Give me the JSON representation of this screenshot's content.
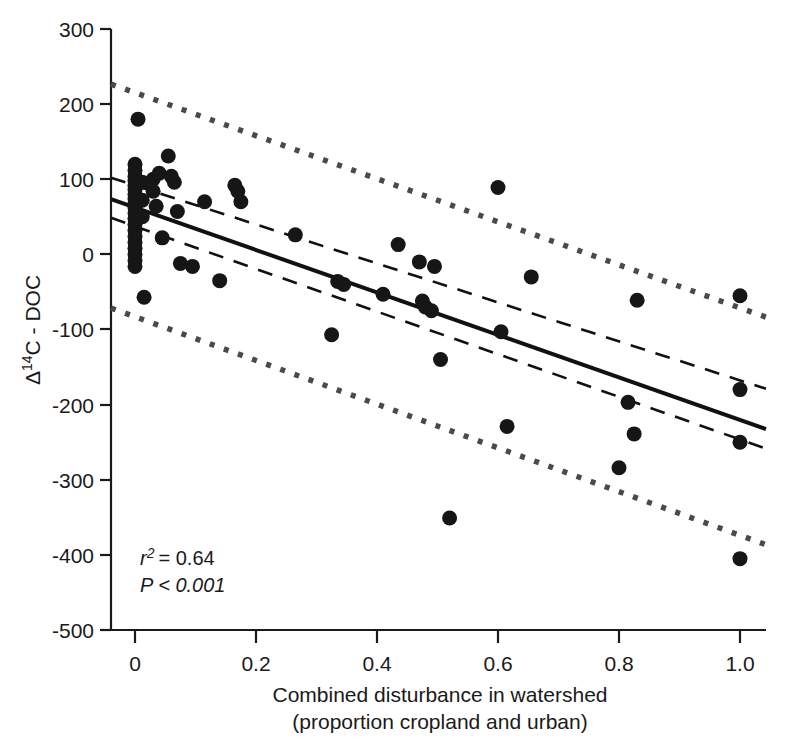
{
  "chart_data": {
    "type": "scatter",
    "title": "",
    "xlabel": "Combined disturbance in watershed",
    "xlabel_line2": "(proportion cropland and urban)",
    "ylabel": "Δ14C - DOC",
    "ylabel_delta": "Δ",
    "ylabel_sup": "14",
    "ylabel_rest": "C - DOC",
    "xlim": [
      -0.06,
      1.06
    ],
    "ylim": [
      -500,
      300
    ],
    "xticks": [
      0,
      0.2,
      0.4,
      0.6,
      0.8,
      1.0
    ],
    "xtick_labels": [
      "0",
      "0.2",
      "0.4",
      "0.6",
      "0.8",
      "1.0"
    ],
    "yticks": [
      300,
      200,
      100,
      0,
      -100,
      -200,
      -300,
      -400,
      -500
    ],
    "ytick_labels": [
      "300",
      "200",
      "100",
      "0",
      "-100",
      "-200",
      "-300",
      "-400",
      "-500"
    ],
    "grid": false,
    "legend": false,
    "marker": "filled-circle",
    "marker_color": "#161616",
    "marker_radius": 7.5,
    "points": [
      {
        "x": 0.005,
        "y": 180
      },
      {
        "x": 0.0,
        "y": 120
      },
      {
        "x": 0.0,
        "y": 112
      },
      {
        "x": 0.0,
        "y": 104
      },
      {
        "x": 0.0,
        "y": 98
      },
      {
        "x": 0.0,
        "y": 92
      },
      {
        "x": 0.0,
        "y": 86
      },
      {
        "x": 0.0,
        "y": 80
      },
      {
        "x": 0.0,
        "y": 74
      },
      {
        "x": 0.0,
        "y": 68
      },
      {
        "x": 0.0,
        "y": 62
      },
      {
        "x": 0.0,
        "y": 55
      },
      {
        "x": 0.0,
        "y": 48
      },
      {
        "x": 0.0,
        "y": 40
      },
      {
        "x": 0.0,
        "y": 32
      },
      {
        "x": 0.0,
        "y": 24
      },
      {
        "x": 0.0,
        "y": 16
      },
      {
        "x": 0.0,
        "y": 8
      },
      {
        "x": 0.0,
        "y": 0
      },
      {
        "x": 0.0,
        "y": -8
      },
      {
        "x": 0.0,
        "y": -16
      },
      {
        "x": 0.012,
        "y": 96
      },
      {
        "x": 0.012,
        "y": 72
      },
      {
        "x": 0.012,
        "y": 50
      },
      {
        "x": 0.015,
        "y": -57
      },
      {
        "x": 0.03,
        "y": 100
      },
      {
        "x": 0.03,
        "y": 84
      },
      {
        "x": 0.035,
        "y": 64
      },
      {
        "x": 0.04,
        "y": 108
      },
      {
        "x": 0.045,
        "y": 22
      },
      {
        "x": 0.055,
        "y": 131
      },
      {
        "x": 0.06,
        "y": 104
      },
      {
        "x": 0.065,
        "y": 96
      },
      {
        "x": 0.07,
        "y": 57
      },
      {
        "x": 0.075,
        "y": -12
      },
      {
        "x": 0.095,
        "y": -16
      },
      {
        "x": 0.115,
        "y": 70
      },
      {
        "x": 0.14,
        "y": -35
      },
      {
        "x": 0.165,
        "y": 92
      },
      {
        "x": 0.17,
        "y": 84
      },
      {
        "x": 0.175,
        "y": 70
      },
      {
        "x": 0.265,
        "y": 26
      },
      {
        "x": 0.325,
        "y": -107
      },
      {
        "x": 0.335,
        "y": -36
      },
      {
        "x": 0.345,
        "y": -40
      },
      {
        "x": 0.41,
        "y": -53
      },
      {
        "x": 0.435,
        "y": 13
      },
      {
        "x": 0.47,
        "y": -10
      },
      {
        "x": 0.475,
        "y": -62
      },
      {
        "x": 0.48,
        "y": -70
      },
      {
        "x": 0.49,
        "y": -75
      },
      {
        "x": 0.495,
        "y": -16
      },
      {
        "x": 0.505,
        "y": -140
      },
      {
        "x": 0.52,
        "y": -351
      },
      {
        "x": 0.6,
        "y": 89
      },
      {
        "x": 0.605,
        "y": -103
      },
      {
        "x": 0.615,
        "y": -229
      },
      {
        "x": 0.655,
        "y": -30
      },
      {
        "x": 0.8,
        "y": -284
      },
      {
        "x": 0.815,
        "y": -197
      },
      {
        "x": 0.825,
        "y": -239
      },
      {
        "x": 0.83,
        "y": -61
      },
      {
        "x": 1.0,
        "y": -55
      },
      {
        "x": 1.0,
        "y": -180
      },
      {
        "x": 1.0,
        "y": -250
      },
      {
        "x": 1.0,
        "y": -405
      }
    ],
    "fit_line": {
      "name": "regression line",
      "style": "solid",
      "x0": -0.055,
      "y0": 78,
      "x1": 1.055,
      "y1": -236
    },
    "confidence_band": {
      "name": "95% confidence interval",
      "style": "dashed",
      "upper": {
        "x0": -0.055,
        "y0": 106,
        "x1": 1.055,
        "y1": -182
      },
      "lower": {
        "x0": -0.055,
        "y0": 53,
        "x1": 1.055,
        "y1": -262
      }
    },
    "prediction_band": {
      "name": "95% prediction interval",
      "style": "dotted",
      "upper": {
        "x0": -0.055,
        "y0": 231,
        "x1": 1.055,
        "y1": -87
      },
      "lower": {
        "x0": -0.055,
        "y0": -67,
        "x1": 1.055,
        "y1": -390
      }
    },
    "annotations": {
      "r_squared_symbol": "r",
      "r_squared_sup": "2",
      "r_squared_value": "= 0.64",
      "r_squared_full": "r2 = 0.64",
      "p_value": "P < 0.001"
    }
  }
}
